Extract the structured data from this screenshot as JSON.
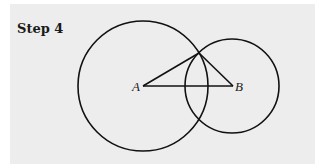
{
  "figure": {
    "title": "Step 4",
    "points": {
      "A": {
        "label": "A"
      },
      "B": {
        "label": "B"
      }
    },
    "elements": [
      "circle centered at A through apex",
      "circle centered at B through apex",
      "segment AB",
      "segment A-apex",
      "segment B-apex"
    ]
  }
}
